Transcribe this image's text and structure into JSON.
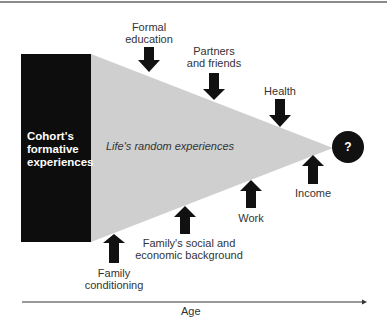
{
  "diagram": {
    "block": {
      "label": "Cohort's formative experiences",
      "lines": [
        "Cohort's",
        "formative",
        "experiences"
      ]
    },
    "wedge_label": "Life's random experiences",
    "outcome": {
      "symbol": "?"
    },
    "top_influences": [
      {
        "lines": [
          "Formal",
          "education"
        ]
      },
      {
        "lines": [
          "Partners",
          "and friends"
        ]
      },
      {
        "lines": [
          "Health"
        ]
      }
    ],
    "bottom_influences": [
      {
        "lines": [
          "Family",
          "conditioning"
        ]
      },
      {
        "lines": [
          "Family's social and",
          "economic background"
        ]
      },
      {
        "lines": [
          "Work"
        ]
      },
      {
        "lines": [
          "Income"
        ]
      }
    ],
    "axis": {
      "label": "Age"
    },
    "colors": {
      "block": "#0d0d0d",
      "wedge": "#cfcfcf",
      "arrow": "#111111",
      "circle": "#111111"
    }
  }
}
